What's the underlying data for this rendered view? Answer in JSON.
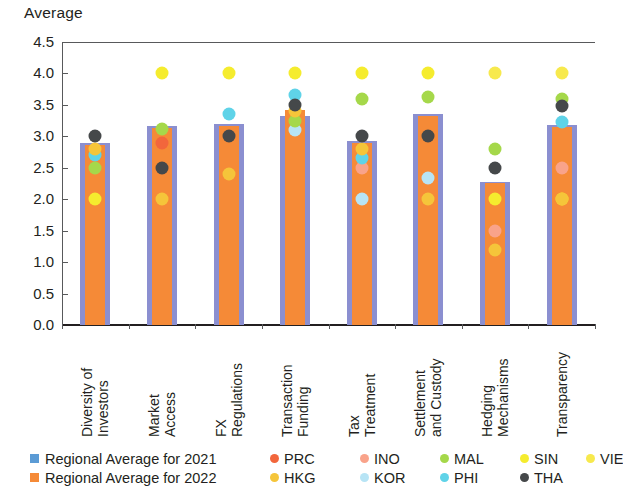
{
  "chart_data": {
    "type": "bar",
    "title": "",
    "ylabel": "Average",
    "xlabel": "",
    "ylim": [
      0.0,
      4.5
    ],
    "ytick_labels": [
      "4.5",
      "4.0",
      "3.5",
      "3.0",
      "2.5",
      "2.0",
      "1.5",
      "1.0",
      "0.5",
      "0.0"
    ],
    "ytick_values": [
      4.5,
      4.0,
      3.5,
      3.0,
      2.5,
      2.0,
      1.5,
      1.0,
      0.5,
      0.0
    ],
    "grid": false,
    "legend_position": "bottom",
    "categories": [
      "Diversity of Investors",
      "Market Access",
      "FX Regulations",
      "Transaction Funding",
      "Tax Treatment",
      "Settlement and Custody",
      "Hedging Mechanisms",
      "Transparency"
    ],
    "category_lines": [
      [
        "Diversity of",
        "Investors"
      ],
      [
        "Market",
        "Access"
      ],
      [
        "FX",
        "Regulations"
      ],
      [
        "Transaction",
        "Funding"
      ],
      [
        "Tax",
        "Treatment"
      ],
      [
        "Settlement",
        "and Custody"
      ],
      [
        "Hedging",
        "Mechanisms"
      ],
      [
        "Transparency"
      ]
    ],
    "series": [
      {
        "name": "Regional Average for 2021",
        "kind": "bar",
        "color": "#8b8fd0",
        "values": [
          2.9,
          3.17,
          3.2,
          3.33,
          2.92,
          3.35,
          2.28,
          3.18
        ]
      },
      {
        "name": "Regional Average for 2022",
        "kind": "bar",
        "color": "#f58a37",
        "values": [
          2.87,
          3.14,
          3.17,
          3.42,
          2.9,
          3.32,
          2.26,
          3.15
        ]
      }
    ],
    "scatter_series": [
      {
        "name": "PRC",
        "color": "#f2663c",
        "values": [
          null,
          2.9,
          null,
          null,
          null,
          null,
          null,
          null
        ]
      },
      {
        "name": "INO",
        "color": "#f9a38a",
        "values": [
          null,
          null,
          null,
          null,
          2.5,
          null,
          1.5,
          2.5
        ]
      },
      {
        "name": "MAL",
        "color": "#a5d84a",
        "values": [
          2.5,
          3.12,
          null,
          3.25,
          3.6,
          3.63,
          2.8,
          3.6
        ]
      },
      {
        "name": "SIN",
        "color": "#f5ec2e",
        "values": [
          2.0,
          4.0,
          4.0,
          4.0,
          4.0,
          4.0,
          2.0,
          2.0
        ]
      },
      {
        "name": "VIE",
        "color": "#f7e94d",
        "values": [
          null,
          null,
          null,
          null,
          null,
          null,
          4.0,
          4.0
        ]
      },
      {
        "name": "HKG",
        "color": "#f5c53a",
        "values": [
          2.8,
          2.0,
          2.4,
          3.4,
          2.8,
          2.0,
          1.2,
          2.0
        ]
      },
      {
        "name": "KOR",
        "color": "#b7e4f5",
        "values": [
          null,
          null,
          null,
          3.1,
          2.0,
          2.33,
          null,
          null
        ]
      },
      {
        "name": "PHI",
        "color": "#5fd3e8",
        "values": [
          2.7,
          null,
          3.35,
          3.65,
          2.65,
          null,
          null,
          3.22
        ]
      },
      {
        "name": "THA",
        "color": "#45484a",
        "values": [
          3.0,
          2.5,
          3.0,
          3.5,
          3.0,
          3.0,
          2.5,
          3.48
        ]
      }
    ]
  },
  "legend": {
    "row1": [
      {
        "label": "Regional Average for 2021",
        "marker": "square",
        "color": "#5b9bd5"
      },
      {
        "label": "PRC",
        "marker": "circle",
        "color": "#f2663c"
      },
      {
        "label": "INO",
        "marker": "circle",
        "color": "#f9a38a"
      },
      {
        "label": "MAL",
        "marker": "circle",
        "color": "#a5d84a"
      },
      {
        "label": "SIN",
        "marker": "circle",
        "color": "#f5ec2e"
      },
      {
        "label": "VIE",
        "marker": "circle",
        "color": "#f7e94d"
      }
    ],
    "row2": [
      {
        "label": "Regional Average for 2022",
        "marker": "square",
        "color": "#f58a37"
      },
      {
        "label": "HKG",
        "marker": "circle",
        "color": "#f5c53a"
      },
      {
        "label": "KOR",
        "marker": "circle",
        "color": "#b7e4f5"
      },
      {
        "label": "PHI",
        "marker": "circle",
        "color": "#5fd3e8"
      },
      {
        "label": "THA",
        "marker": "circle",
        "color": "#45484a"
      }
    ]
  }
}
